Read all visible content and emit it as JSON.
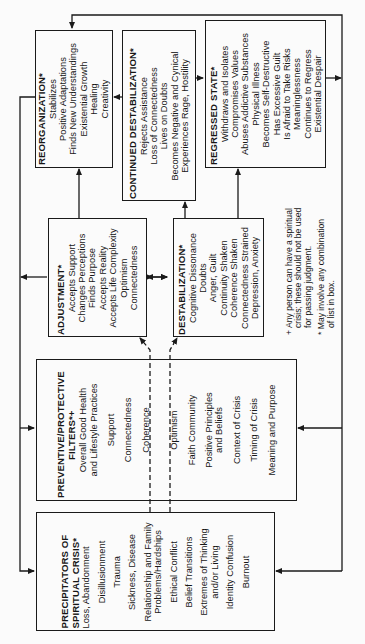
{
  "boxes": {
    "reorganization": {
      "title": "REORGANIZATION*",
      "items": [
        "Stabilizes",
        "Positive Adaptations",
        "Finds New Understandings",
        "Existential Growth",
        "Healing",
        "Creativity"
      ]
    },
    "continued_destabilization": {
      "title": "CONTINUED DESTABILIZATION*",
      "items": [
        "Rejects Assistance",
        "Loss of Connectedness",
        "Lives on Doubts",
        "Becomes Negative and Cynical",
        "Experiences Rage, Hostility"
      ]
    },
    "regressed_state": {
      "title": "REGRESSED STATE*",
      "items": [
        "Withdraws and Isolates",
        "Compromises Values",
        "Abuses Addictive Substances",
        "Physical Illness",
        "Becomes Self-Destructive",
        "Has Excessive Guilt",
        "Is Afraid to Take Risks",
        "Meaninglessness",
        "Continues to Regress",
        "Existential Despair"
      ]
    },
    "adjustment": {
      "title": "ADJUSTMENT*",
      "items": [
        "Accepts Support",
        "Changes Perceptions",
        "Finds Purpose",
        "Accepts Reality",
        "Accepts Life Complexity",
        "Optimism",
        "Connectedness"
      ]
    },
    "destabilization": {
      "title": "DESTABILIZATION*",
      "items": [
        "Cognitive Dissonance",
        "Doubts",
        "Anger, Guilt",
        "Continuity Shaken",
        "Coherence Shaken",
        "Connectedness Strained",
        "Depression, Anxiety"
      ]
    },
    "filters": {
      "title_line1": "PREVENTIVE/PROTECTIVE",
      "title_line2": "FILTERS*+",
      "items": [
        "Overall Good Health|and Lifestyle Practices",
        "Support",
        "Connectedness",
        "Coherence",
        "Optimism",
        "Faith Community",
        "Positive Principles|and Beliefs",
        "Context of Crisis",
        "Timing of Crisis",
        "Meaning and Purpose"
      ]
    },
    "precipitators": {
      "title_line1": "PRECIPITATORS OF",
      "title_line2": "SPIRITUAL CRISIS*",
      "items": [
        "Loss, Abandonment",
        "Disillusionment",
        "Trauma",
        "Sickness, Disease",
        "Relationship and Family|Problems/Hardships",
        "Ethical Conflict",
        "Belief Transitions",
        "Extremes of Thinking|and/or Living",
        "Identity Confusion",
        "Burnout"
      ]
    }
  },
  "notes": {
    "plus_note": "+ Any person can have a spiritual crisis; these should not be used for passing judgment.",
    "plus_line1": "+ Any person can have a spiritual",
    "plus_line2": "crisis; these should not be used",
    "plus_line3": "for passing judgment.",
    "star_line1": "* May involve any combination",
    "star_line2": "of list in box."
  },
  "colors": {
    "line": "#1a1a1a",
    "background": "#fbfbfb"
  }
}
